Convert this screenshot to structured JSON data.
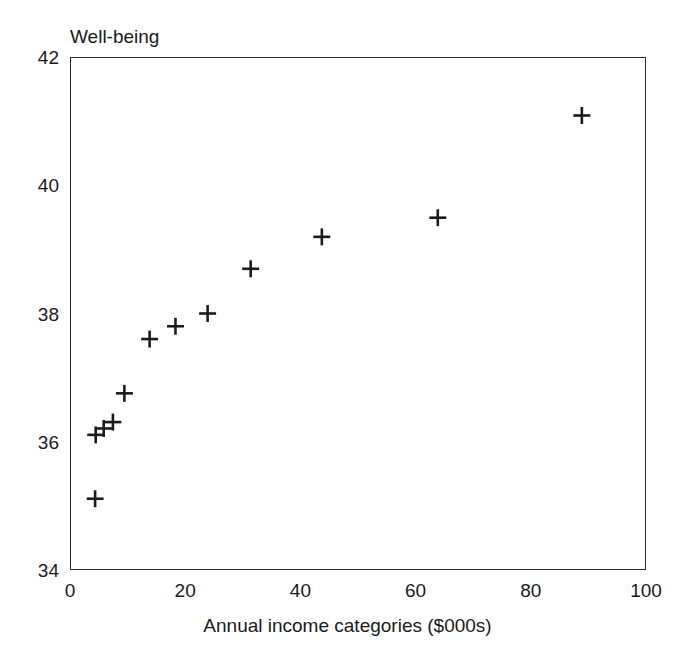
{
  "chart_data": {
    "type": "scatter",
    "title": "",
    "ylabel": "Well-being",
    "xlabel": "Annual income categories ($000s)",
    "xlim": [
      0,
      100
    ],
    "ylim": [
      34,
      42
    ],
    "xticks": [
      0,
      20,
      40,
      60,
      80,
      100
    ],
    "yticks": [
      34,
      36,
      38,
      40,
      42
    ],
    "grid": false,
    "legend": false,
    "marker": "plus",
    "marker_color": "#1a1a1a",
    "series": [
      {
        "name": "Well-being vs annual income",
        "points": [
          {
            "x": 4.2,
            "y": 35.1
          },
          {
            "x": 4.3,
            "y": 36.1
          },
          {
            "x": 5.7,
            "y": 36.2
          },
          {
            "x": 7.3,
            "y": 36.3
          },
          {
            "x": 9.3,
            "y": 36.75
          },
          {
            "x": 13.7,
            "y": 37.6
          },
          {
            "x": 18.2,
            "y": 37.8
          },
          {
            "x": 23.8,
            "y": 38.0
          },
          {
            "x": 31.3,
            "y": 38.7
          },
          {
            "x": 43.7,
            "y": 39.2
          },
          {
            "x": 63.9,
            "y": 39.5
          },
          {
            "x": 89.0,
            "y": 41.1
          }
        ]
      }
    ]
  }
}
